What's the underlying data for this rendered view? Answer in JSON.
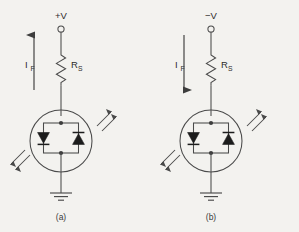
{
  "figure": {
    "background_color": "#f3f2ef",
    "line_color": "#4a4a4a",
    "fill_color": "#1c1c1c",
    "panels": [
      {
        "id": "a",
        "caption": "(a)",
        "supply_label": "+V",
        "supply_polarity": "positive",
        "current_label": "I",
        "current_subscript": "F",
        "current_direction": "up",
        "resistor_label": "R",
        "resistor_subscript": "S",
        "device": "bidirectional-led",
        "diode_left_direction": "down",
        "diode_right_direction": "up",
        "ground": "earth-ground",
        "emission_arrows": [
          "upper-right",
          "lower-left"
        ]
      },
      {
        "id": "b",
        "caption": "(b)",
        "supply_label": "−V",
        "supply_polarity": "negative",
        "current_label": "I",
        "current_subscript": "F",
        "current_direction": "down",
        "resistor_label": "R",
        "resistor_subscript": "S",
        "device": "bidirectional-led",
        "diode_left_direction": "down",
        "diode_right_direction": "up",
        "ground": "earth-ground",
        "emission_arrows": [
          "upper-right",
          "lower-left"
        ]
      }
    ]
  }
}
